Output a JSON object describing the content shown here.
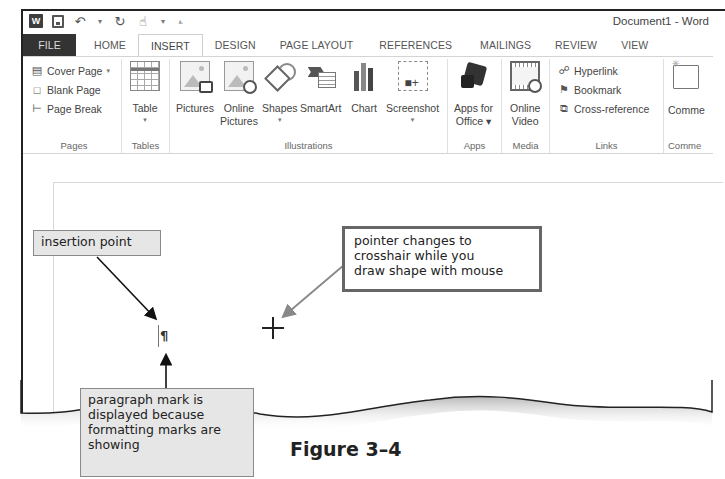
{
  "window": {
    "title": "Document1 - Word",
    "quick_access": [
      {
        "name": "word-logo-icon",
        "glyph": "W"
      },
      {
        "name": "save-icon",
        "glyph": ""
      },
      {
        "name": "undo-icon",
        "glyph": "↶"
      },
      {
        "name": "redo-icon",
        "glyph": "↻"
      },
      {
        "name": "touch-mode-icon",
        "glyph": "☝"
      },
      {
        "name": "customize-qat-icon",
        "glyph": "⫠"
      }
    ]
  },
  "tabs": [
    {
      "label": "FILE",
      "state": "file"
    },
    {
      "label": "HOME"
    },
    {
      "label": "INSERT",
      "state": "active"
    },
    {
      "label": "DESIGN"
    },
    {
      "label": "PAGE LAYOUT"
    },
    {
      "label": "REFERENCES"
    },
    {
      "label": "MAILINGS"
    },
    {
      "label": "REVIEW"
    },
    {
      "label": "VIEW"
    }
  ],
  "ribbon": {
    "pages": {
      "label": "Pages",
      "items": [
        {
          "label": "Cover Page",
          "dropdown": "▾",
          "icon": "cover-page-icon"
        },
        {
          "label": "Blank Page",
          "icon": "blank-page-icon"
        },
        {
          "label": "Page Break",
          "icon": "page-break-icon"
        }
      ]
    },
    "tables": {
      "label": "Tables",
      "items": [
        {
          "label": "Table",
          "dropdown": "▾"
        }
      ]
    },
    "illustrations": {
      "label": "Illustrations",
      "items": [
        {
          "label": "Pictures"
        },
        {
          "label": "Online\nPictures"
        },
        {
          "label": "Shapes",
          "dropdown": "▾"
        },
        {
          "label": "SmartArt"
        },
        {
          "label": "Chart"
        },
        {
          "label": "Screenshot",
          "dropdown": "▾"
        }
      ]
    },
    "apps": {
      "label": "Apps",
      "items": [
        {
          "label": "Apps for",
          "label2": "Office ▾"
        }
      ]
    },
    "media": {
      "label": "Media",
      "items": [
        {
          "label": "Online",
          "label2": "Video"
        }
      ]
    },
    "links": {
      "label": "Links",
      "items": [
        {
          "label": "Hyperlink",
          "icon": "hyperlink-icon"
        },
        {
          "label": "Bookmark",
          "icon": "bookmark-icon"
        },
        {
          "label": "Cross-reference",
          "icon": "cross-reference-icon"
        }
      ]
    },
    "comments": {
      "label": "Comme",
      "items": [
        {
          "label": "Comme"
        }
      ]
    }
  },
  "annotations": {
    "insertion_point": "insertion point",
    "pointer_callout": [
      "pointer changes to",
      "crosshair while you",
      "draw shape with mouse"
    ],
    "paragraph_callout": [
      "paragraph mark is",
      "displayed because",
      "formatting marks are",
      "showing"
    ],
    "pilcrow": "¶"
  },
  "figure_caption": "Figure 3–4"
}
